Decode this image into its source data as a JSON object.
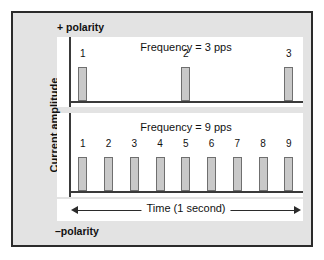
{
  "figure": {
    "y_axis_label": "Current amplitude",
    "positive_polarity_label": "+ polarity",
    "negative_polarity_label": "–polarity",
    "time_axis_label": "Time (1 second)",
    "colors": {
      "frame_border": "#2b2b2b",
      "frame_fill": "#e3e3e3",
      "panel_fill": "#ffffff",
      "axis_line": "#3a3a3a",
      "pulse_fill": "#c9c9c9",
      "pulse_border": "#6f6f6f",
      "text": "#111111"
    }
  },
  "chart_data": {
    "type": "bar",
    "title": "",
    "xlabel": "Time (1 second)",
    "ylabel": "Current amplitude",
    "grid": false,
    "legend": "none",
    "panels": [
      {
        "name": "top-panel",
        "caption": "Frequency = 3 pps",
        "frequency_pps": 3,
        "categories": [
          "1",
          "2",
          "3"
        ],
        "values": [
          1,
          1,
          1
        ],
        "x_positions_pct": [
          4,
          48,
          92
        ]
      },
      {
        "name": "bottom-panel",
        "caption": "Frequency = 9 pps",
        "frequency_pps": 9,
        "categories": [
          "1",
          "2",
          "3",
          "4",
          "5",
          "6",
          "7",
          "8",
          "9"
        ],
        "values": [
          1,
          1,
          1,
          1,
          1,
          1,
          1,
          1,
          1
        ],
        "x_positions_pct": [
          4,
          15,
          26,
          37,
          48,
          59,
          70,
          81,
          92
        ]
      }
    ]
  }
}
